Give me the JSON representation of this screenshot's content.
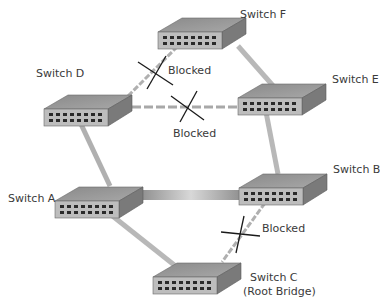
{
  "diagram": {
    "type": "spanning-tree-topology",
    "switches": [
      {
        "id": "F",
        "label": "Switch F",
        "x": 158,
        "y": 16,
        "label_pos": [
          240,
          8
        ]
      },
      {
        "id": "D",
        "label": "Switch D",
        "x": 45,
        "y": 95,
        "label_pos": [
          36,
          66
        ]
      },
      {
        "id": "E",
        "label": "Switch E",
        "x": 238,
        "y": 83,
        "label_pos": [
          332,
          73
        ]
      },
      {
        "id": "A",
        "label": "Switch A",
        "x": 55,
        "y": 183,
        "label_pos": [
          8,
          190
        ]
      },
      {
        "id": "B",
        "label": "Switch B",
        "x": 239,
        "y": 172,
        "label_pos": [
          333,
          163
        ]
      },
      {
        "id": "C",
        "label": "Switch C",
        "sublabel": "(Root Bridge)",
        "x": 153,
        "y": 260,
        "label_pos": [
          248,
          272
        ]
      }
    ],
    "links": [
      {
        "from": "D",
        "to": "F",
        "state": "Blocked",
        "style": "dashed"
      },
      {
        "from": "D",
        "to": "E",
        "state": "Blocked",
        "style": "dashed"
      },
      {
        "from": "F",
        "to": "E",
        "state": "Forwarding",
        "style": "solid"
      },
      {
        "from": "E",
        "to": "B",
        "state": "Forwarding",
        "style": "solid"
      },
      {
        "from": "D",
        "to": "A",
        "state": "Forwarding",
        "style": "solid"
      },
      {
        "from": "A",
        "to": "B",
        "state": "Forwarding",
        "style": "thick"
      },
      {
        "from": "A",
        "to": "C",
        "state": "Forwarding",
        "style": "solid"
      },
      {
        "from": "B",
        "to": "C",
        "state": "Blocked",
        "style": "dashed"
      }
    ],
    "blocked_labels": [
      {
        "text": "Blocked",
        "x": 168,
        "y": 64
      },
      {
        "text": "Blocked",
        "x": 173,
        "y": 128
      },
      {
        "text": "Blocked",
        "x": 262,
        "y": 223
      }
    ],
    "colors": {
      "switch_top": "#9a9a9a",
      "switch_front": "#b8b8b8",
      "switch_side": "#7d7d7d",
      "port": "#2a2a2a",
      "link": "#b4b4b4",
      "blocked_x": "#1a1a1a",
      "text": "#3a3a3a"
    }
  }
}
